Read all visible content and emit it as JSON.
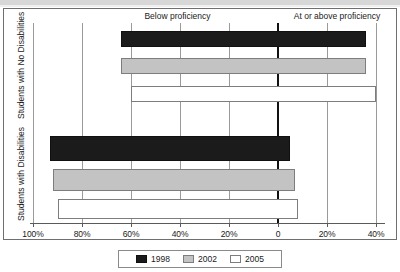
{
  "chart_data": {
    "type": "bar",
    "orientation": "horizontal",
    "layout": "diverging-stacked",
    "title": "",
    "xlabel": "",
    "ylabel": "",
    "grid": true,
    "legend_position": "bottom",
    "xlim": [
      -100,
      40
    ],
    "zero_at": 0,
    "axis_ticks": [
      {
        "label": "100%",
        "value": -100
      },
      {
        "label": "80%",
        "value": -80
      },
      {
        "label": "60%",
        "value": -60
      },
      {
        "label": "40%",
        "value": -40
      },
      {
        "label": "20%",
        "value": -20
      },
      {
        "label": "0",
        "value": 0
      },
      {
        "label": "20%",
        "value": 20
      },
      {
        "label": "40%",
        "value": 40
      }
    ],
    "region_labels": [
      {
        "text": "Below proficiency",
        "side": "left"
      },
      {
        "text": "At or above proficiency",
        "side": "right"
      }
    ],
    "groups": [
      {
        "name": "Students with No Disabilities",
        "bars": [
          {
            "series": "1998",
            "below_proficiency": 64,
            "at_or_above_proficiency": 36
          },
          {
            "series": "2002",
            "below_proficiency": 64,
            "at_or_above_proficiency": 36
          },
          {
            "series": "2005",
            "below_proficiency": 60,
            "at_or_above_proficiency": 40
          }
        ]
      },
      {
        "name": "Students with Disabilities",
        "bars": [
          {
            "series": "1998",
            "below_proficiency": 93,
            "at_or_above_proficiency": 5
          },
          {
            "series": "2002",
            "below_proficiency": 92,
            "at_or_above_proficiency": 7
          },
          {
            "series": "2005",
            "below_proficiency": 90,
            "at_or_above_proficiency": 8
          }
        ]
      }
    ],
    "series": [
      {
        "name": "1998",
        "color": "#1b1b1b"
      },
      {
        "name": "2002",
        "color": "#c3c3c3"
      },
      {
        "name": "2005",
        "color": "#ffffff"
      }
    ]
  },
  "legend": {
    "items": [
      {
        "label": "1998",
        "key": "y1998"
      },
      {
        "label": "2002",
        "key": "y2002"
      },
      {
        "label": "2005",
        "key": "y2005"
      }
    ]
  },
  "axis": {
    "y_labels": [
      "Students with No Disabilities",
      "Students with Disabilities"
    ]
  }
}
